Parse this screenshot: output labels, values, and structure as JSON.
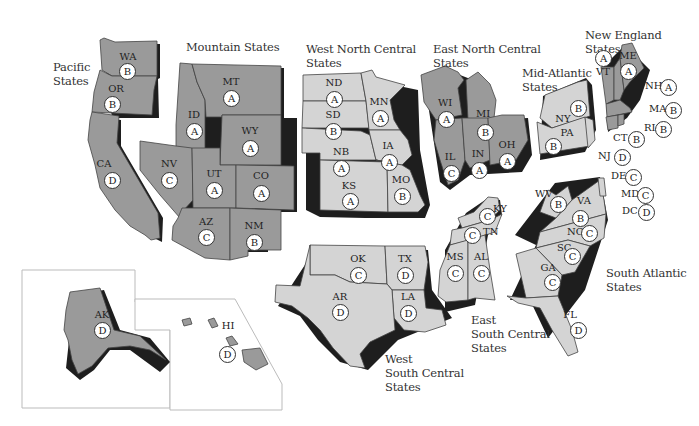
{
  "colors": {
    "dark_region": "#9a9a9a",
    "light_region": "#d4d4d4",
    "shadow": "#1e1e1e",
    "border": "#444444",
    "inset_border": "#bbbbbb"
  },
  "regions": [
    {
      "id": "pacific",
      "label": "Pacific\nStates",
      "shade": "dark"
    },
    {
      "id": "mountain",
      "label": "Mountain States",
      "shade": "dark"
    },
    {
      "id": "west_north_central",
      "label": "West North Central\nStates",
      "shade": "light"
    },
    {
      "id": "east_north_central",
      "label": "East North Central\nStates",
      "shade": "dark"
    },
    {
      "id": "mid_atlantic",
      "label": "Mid-Atlantic\nStates",
      "shade": "light"
    },
    {
      "id": "new_england",
      "label": "New England States",
      "shade": "dark"
    },
    {
      "id": "south_atlantic",
      "label": "South Atlantic\nStates",
      "shade": "light"
    },
    {
      "id": "east_south_central",
      "label": "East\nSouth Central\nStates",
      "shade": "light"
    },
    {
      "id": "west_south_central",
      "label": "West\nSouth Central\nStates",
      "shade": "light"
    }
  ],
  "states": [
    {
      "abbr": "WA",
      "grade": "B",
      "region": "pacific"
    },
    {
      "abbr": "OR",
      "grade": "B",
      "region": "pacific"
    },
    {
      "abbr": "CA",
      "grade": "D",
      "region": "pacific"
    },
    {
      "abbr": "AK",
      "grade": "D",
      "region": "pacific"
    },
    {
      "abbr": "HI",
      "grade": "D",
      "region": "pacific"
    },
    {
      "abbr": "MT",
      "grade": "A",
      "region": "mountain"
    },
    {
      "abbr": "ID",
      "grade": "A",
      "region": "mountain"
    },
    {
      "abbr": "WY",
      "grade": "A",
      "region": "mountain"
    },
    {
      "abbr": "NV",
      "grade": "C",
      "region": "mountain"
    },
    {
      "abbr": "UT",
      "grade": "A",
      "region": "mountain"
    },
    {
      "abbr": "CO",
      "grade": "A",
      "region": "mountain"
    },
    {
      "abbr": "AZ",
      "grade": "C",
      "region": "mountain"
    },
    {
      "abbr": "NM",
      "grade": "B",
      "region": "mountain"
    },
    {
      "abbr": "ND",
      "grade": "A",
      "region": "west_north_central"
    },
    {
      "abbr": "SD",
      "grade": "B",
      "region": "west_north_central"
    },
    {
      "abbr": "NB",
      "grade": "A",
      "region": "west_north_central"
    },
    {
      "abbr": "KS",
      "grade": "A",
      "region": "west_north_central"
    },
    {
      "abbr": "MN",
      "grade": "A",
      "region": "west_north_central"
    },
    {
      "abbr": "IA",
      "grade": "A",
      "region": "west_north_central"
    },
    {
      "abbr": "MO",
      "grade": "B",
      "region": "west_north_central"
    },
    {
      "abbr": "WI",
      "grade": "A",
      "region": "east_north_central"
    },
    {
      "abbr": "MI",
      "grade": "B",
      "region": "east_north_central"
    },
    {
      "abbr": "IL",
      "grade": "C",
      "region": "east_north_central"
    },
    {
      "abbr": "IN",
      "grade": "A",
      "region": "east_north_central"
    },
    {
      "abbr": "OH",
      "grade": "A",
      "region": "east_north_central"
    },
    {
      "abbr": "NY",
      "grade": "B",
      "region": "mid_atlantic"
    },
    {
      "abbr": "PA",
      "grade": "B",
      "region": "mid_atlantic"
    },
    {
      "abbr": "NJ",
      "grade": "D",
      "region": "mid_atlantic"
    },
    {
      "abbr": "ME",
      "grade": "A",
      "region": "new_england"
    },
    {
      "abbr": "VT",
      "grade": "A",
      "region": "new_england"
    },
    {
      "abbr": "NH",
      "grade": "A",
      "region": "new_england"
    },
    {
      "abbr": "MA",
      "grade": "B",
      "region": "new_england"
    },
    {
      "abbr": "RI",
      "grade": "B",
      "region": "new_england"
    },
    {
      "abbr": "CT",
      "grade": "B",
      "region": "new_england"
    },
    {
      "abbr": "DE",
      "grade": "C",
      "region": "south_atlantic"
    },
    {
      "abbr": "MD",
      "grade": "C",
      "region": "south_atlantic"
    },
    {
      "abbr": "DC",
      "grade": "D",
      "region": "south_atlantic"
    },
    {
      "abbr": "WV",
      "grade": "B",
      "region": "south_atlantic"
    },
    {
      "abbr": "VA",
      "grade": "B",
      "region": "south_atlantic"
    },
    {
      "abbr": "NC",
      "grade": "C",
      "region": "south_atlantic"
    },
    {
      "abbr": "SC",
      "grade": "C",
      "region": "south_atlantic"
    },
    {
      "abbr": "GA",
      "grade": "C",
      "region": "south_atlantic"
    },
    {
      "abbr": "FL",
      "grade": "D",
      "region": "south_atlantic"
    },
    {
      "abbr": "KY",
      "grade": "C",
      "region": "east_south_central"
    },
    {
      "abbr": "TN",
      "grade": "C",
      "region": "east_south_central"
    },
    {
      "abbr": "MS",
      "grade": "C",
      "region": "east_south_central"
    },
    {
      "abbr": "AL",
      "grade": "C",
      "region": "east_south_central"
    },
    {
      "abbr": "OK",
      "grade": "C",
      "region": "west_south_central"
    },
    {
      "abbr": "TX",
      "grade": "D",
      "region": "west_south_central"
    },
    {
      "abbr": "AR",
      "grade": "D",
      "region": "west_south_central"
    },
    {
      "abbr": "LA",
      "grade": "D",
      "region": "west_south_central"
    }
  ]
}
